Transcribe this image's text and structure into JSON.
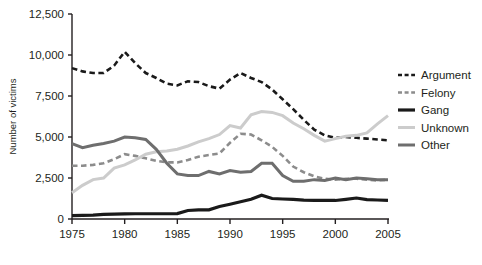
{
  "chart_data": {
    "type": "line",
    "title": "",
    "xlabel": "",
    "ylabel": "Number of victims",
    "xlim": [
      1975,
      2005
    ],
    "ylim": [
      0,
      12500
    ],
    "grid": false,
    "legend_position": "right",
    "xticks": [
      1975,
      1980,
      1985,
      1990,
      1995,
      2000,
      2005
    ],
    "xtick_labels": [
      "1975",
      "1980",
      "1985",
      "1990",
      "1995",
      "2000",
      "2005"
    ],
    "yticks": [
      0,
      2500,
      5000,
      7500,
      10000,
      12500
    ],
    "ytick_labels": [
      "0",
      "2,500",
      "5,000",
      "7,500",
      "10,000",
      "12,500"
    ],
    "x": [
      1975,
      1976,
      1977,
      1978,
      1979,
      1980,
      1981,
      1982,
      1983,
      1984,
      1985,
      1986,
      1987,
      1988,
      1989,
      1990,
      1991,
      1992,
      1993,
      1994,
      1995,
      1996,
      1997,
      1998,
      1999,
      2000,
      2001,
      2002,
      2003,
      2004,
      2005
    ],
    "series": [
      {
        "name": "Argument",
        "color": "#1a1a1a",
        "style": "dashed",
        "width": 2.6,
        "values": [
          9200,
          9000,
          8900,
          8900,
          9350,
          10200,
          9500,
          8900,
          8600,
          8250,
          8150,
          8400,
          8350,
          8100,
          7950,
          8500,
          8900,
          8600,
          8350,
          7900,
          7300,
          6700,
          6050,
          5450,
          5100,
          4950,
          5000,
          4950,
          4900,
          4850,
          4800
        ]
      },
      {
        "name": "Felony",
        "color": "#8c8c8c",
        "style": "dashed",
        "width": 2.6,
        "values": [
          3250,
          3250,
          3300,
          3400,
          3650,
          3950,
          3850,
          3700,
          3550,
          3450,
          3450,
          3600,
          3800,
          3900,
          4000,
          4650,
          5200,
          5150,
          4800,
          4400,
          3850,
          3200,
          2850,
          2600,
          2450,
          2400,
          2450,
          2450,
          2400,
          2350,
          2400
        ]
      },
      {
        "name": "Gang",
        "color": "#1a1a1a",
        "style": "solid",
        "width": 3.2,
        "values": [
          200,
          220,
          240,
          280,
          300,
          310,
          320,
          320,
          320,
          320,
          330,
          520,
          560,
          560,
          760,
          900,
          1050,
          1200,
          1450,
          1250,
          1220,
          1200,
          1150,
          1130,
          1130,
          1130,
          1200,
          1280,
          1180,
          1160,
          1140
        ]
      },
      {
        "name": "Unknown",
        "color": "#cccccc",
        "style": "solid",
        "width": 3.0,
        "values": [
          1600,
          2050,
          2400,
          2500,
          3100,
          3300,
          3600,
          3950,
          4100,
          4150,
          4250,
          4450,
          4700,
          4900,
          5150,
          5700,
          5550,
          6350,
          6550,
          6500,
          6300,
          5850,
          5500,
          5100,
          4750,
          4900,
          5050,
          5100,
          5250,
          5800,
          6300
        ]
      },
      {
        "name": "Other",
        "color": "#6e6e6e",
        "style": "solid",
        "width": 3.0,
        "values": [
          4600,
          4350,
          4500,
          4600,
          4750,
          5000,
          4950,
          4850,
          4250,
          3400,
          2750,
          2650,
          2650,
          2900,
          2750,
          2950,
          2850,
          2900,
          3400,
          3400,
          2650,
          2300,
          2300,
          2400,
          2350,
          2500,
          2400,
          2500,
          2450,
          2400,
          2400
        ]
      }
    ]
  },
  "legend": {
    "items": [
      {
        "label": "Argument"
      },
      {
        "label": "Felony"
      },
      {
        "label": "Gang"
      },
      {
        "label": "Unknown"
      },
      {
        "label": "Other"
      }
    ]
  }
}
